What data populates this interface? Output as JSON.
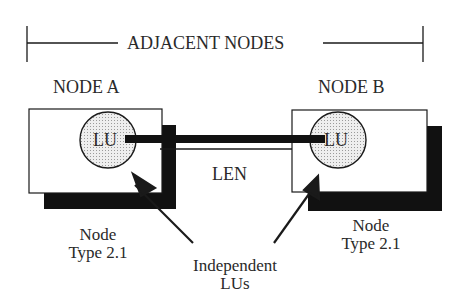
{
  "diagram": {
    "title": "ADJACENT NODES",
    "nodes": [
      {
        "name": "NODE A",
        "lu_label": "LU",
        "type_line1": "Node",
        "type_line2": "Type 2.1"
      },
      {
        "name": "NODE B",
        "lu_label": "LU",
        "type_line1": "Node",
        "type_line2": "Type 2.1"
      }
    ],
    "link_label": "LEN",
    "callout_line1": "Independent",
    "callout_line2": "LUs",
    "colors": {
      "ink": "#1a1a1a",
      "lu_fill": "#dcdcdc",
      "background": "#ffffff"
    }
  }
}
